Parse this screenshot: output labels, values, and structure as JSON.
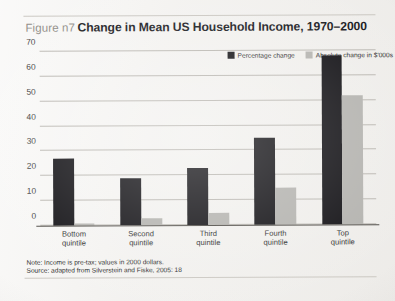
{
  "figure": {
    "label": "Figure n7",
    "title": "Change in Mean US Household Income, 1970–2000"
  },
  "notes": {
    "line1": "Note: Income is pre-tax; values in 2000 dollars.",
    "line2": "Source: adapted from Silverstein and Fiske, 2005: 18"
  },
  "colors": {
    "series_dark": "#111014",
    "series_light": "#b3b2ae",
    "gridline": "#b9b6b0",
    "axis": "#4a4742",
    "page": "#f3f2f0",
    "label_gray": "#8e8b85"
  },
  "chart_data": {
    "type": "bar",
    "title": "Change in Mean US Household Income, 1970–2000",
    "xlabel": "",
    "ylabel": "",
    "ylim": [
      0,
      70
    ],
    "yticks": [
      0,
      10,
      20,
      30,
      40,
      50,
      60,
      70
    ],
    "ytick_labels": [
      "0",
      "10",
      "20",
      "30",
      "40",
      "50",
      "60",
      "70"
    ],
    "grid": true,
    "legend_position": "top-right",
    "categories": [
      "Bottom\nquintile",
      "Second\nquintile",
      "Third\nquintile",
      "Fourth\nquintile",
      "Top\nquintile"
    ],
    "series": [
      {
        "name": "Percentage change",
        "color": "#111014",
        "values": [
          27,
          19,
          23,
          35,
          68
        ]
      },
      {
        "name": "Absolute change in $'000s",
        "color": "#b3b2ae",
        "values": [
          1,
          3,
          5,
          15,
          52
        ]
      }
    ]
  }
}
